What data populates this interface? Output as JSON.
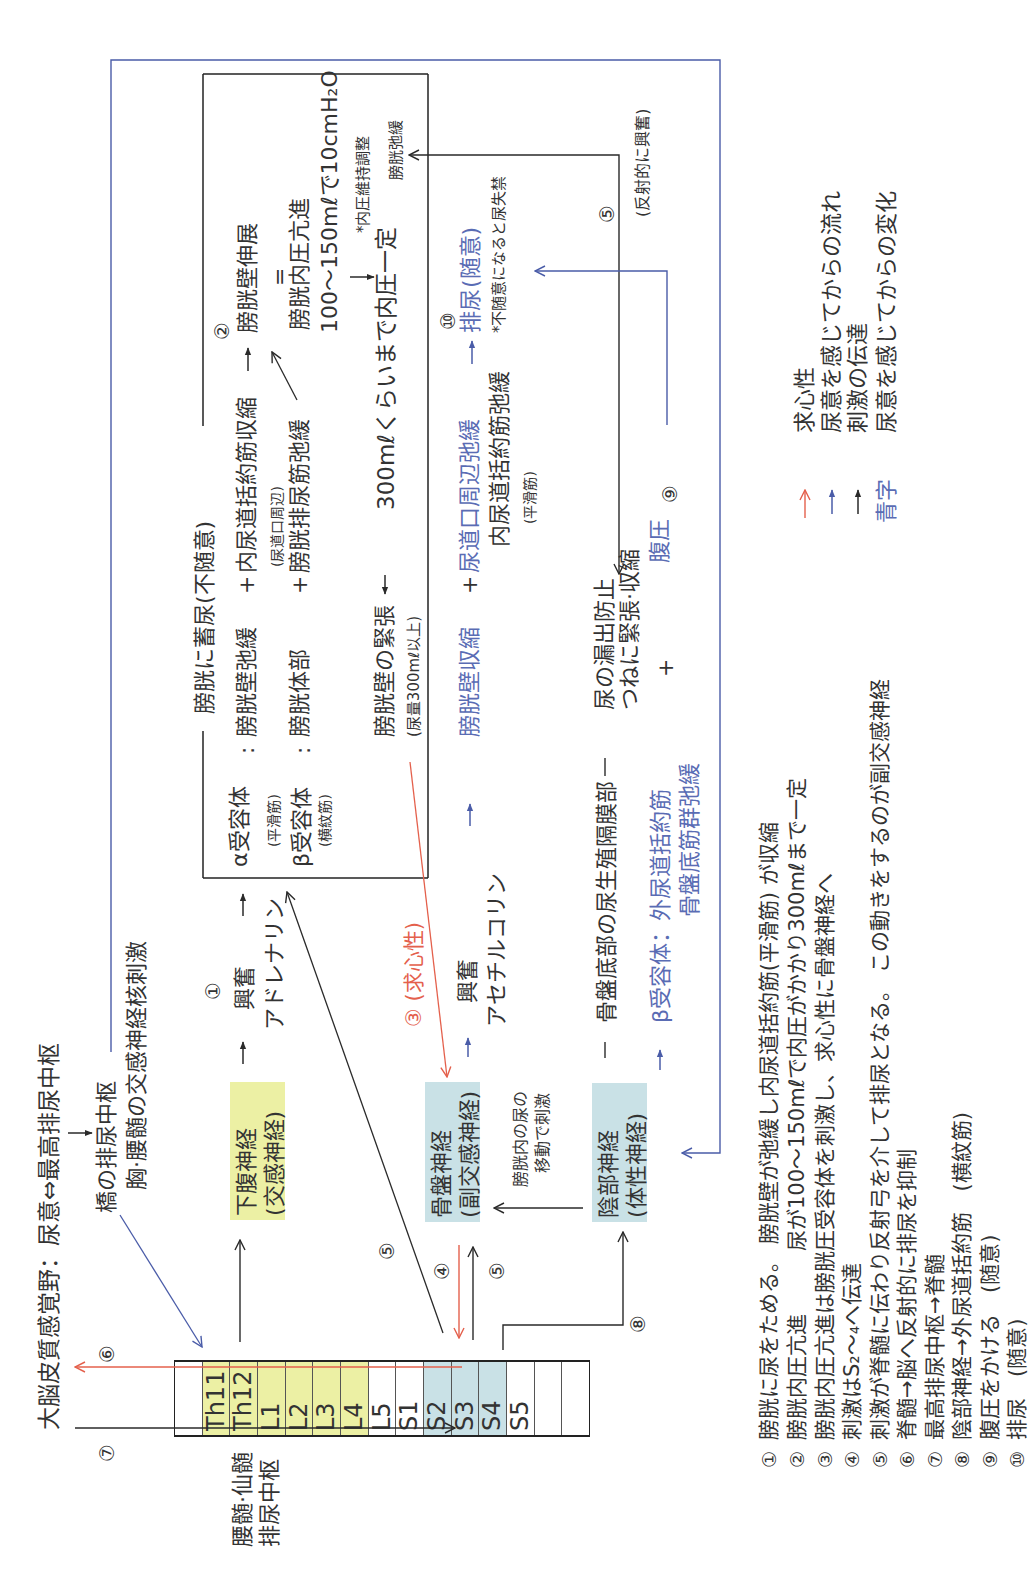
{
  "header": {
    "cortex": "大脳皮質感覚野：尿意⇔最高排尿中枢",
    "pons": "橋の排尿中枢",
    "pons_sub": "胸·腰髄の交感神経核刺激"
  },
  "spinal": {
    "label_line1": "腰髄·仙髄",
    "label_line2": "排尿中枢",
    "segments": [
      "",
      "Th11",
      "Th12",
      "L1",
      "L2",
      "L3",
      "L4",
      "L5",
      "S1",
      "S2",
      "S3",
      "S4",
      "S5",
      "",
      ""
    ]
  },
  "nerves": {
    "hypogastric": {
      "name": "下腹神経",
      "type": "(交感神経)"
    },
    "pelvic": {
      "name": "骨盤神経",
      "type": "(副交感神経)"
    },
    "pudendal": {
      "name": "陰部神経",
      "type": "(体性神経)"
    }
  },
  "markers": {
    "m1": "①",
    "m2": "②",
    "m4": "④",
    "m5": "⑤",
    "m6": "⑥",
    "m7": "⑦",
    "m8": "⑧",
    "m9": "⑨",
    "m10": "⑩"
  },
  "sympathetic_path": {
    "excite": "興奮",
    "transmitter": "アドレナリン"
  },
  "parasympathetic_path": {
    "afferent_label": "③ (求心性)",
    "excite": "興奮",
    "transmitter": "アセチルコリン",
    "stimulus_line1": "膀胱内の尿の",
    "stimulus_line2": "移動で刺激"
  },
  "storage_box": {
    "title": "膀胱に蓄尿(不随意)",
    "alpha": "α受容体",
    "alpha_type": "(平滑筋)",
    "beta": "β受容体",
    "beta_type": "(横紋筋)",
    "colon": ":",
    "wall_relax": "膀胱壁弛緩",
    "plus": "+",
    "internal_contract": "内尿道括約筋収縮",
    "internal_area": "(尿道口周辺)",
    "body": "膀胱体部",
    "detrusor_relax": "膀胱排尿筋弛緩",
    "stretch": "膀胱壁伸展",
    "equals": "=",
    "pressure": "膀胱内圧亢進",
    "pressure_value": "100〜150mℓで10cmH₂O",
    "maintain_note": "*内圧維持調整",
    "wall_tension": "膀胱壁の緊張",
    "volume_note": "(尿量300mℓ以上)",
    "constant": "300mℓくらいまで内圧一定",
    "relax": "膀胱弛緩"
  },
  "voiding": {
    "wall_contract": "膀胱壁収縮",
    "plus": "+",
    "urethral_relax": "尿道口周辺弛緩",
    "internal_relax": "内尿道括約筋弛緩",
    "internal_type": "(平滑筋)",
    "void": "排尿",
    "voluntary": "(随意)",
    "incontinence_note": "*不随意になると尿失禁"
  },
  "pelvic_floor": {
    "region": "骨盤底部の尿生殖隔膜部",
    "leak": "尿の漏出防止",
    "tension": "つねに緊張·収縮",
    "plus": "+",
    "abdominal": "腹圧",
    "beta_external": "β受容体：外尿道括約筋",
    "floor_relax": "骨盤底筋群弛緩",
    "reflex": "(反射的に興奮)"
  },
  "legend": [
    {
      "symbol": "red-arrow",
      "label": "求心性"
    },
    {
      "symbol": "blue-arrow",
      "label": "尿意を感じてからの流れ"
    },
    {
      "symbol": "black-arrow",
      "label": "刺激の伝達"
    },
    {
      "symbol": "青字",
      "label": "尿意を感じてからの変化"
    }
  ],
  "notes": [
    {
      "num": "①",
      "text": "膀胱に尿をためる。 膀胱壁が弛緩し内尿道括約筋(平滑筋) が収縮"
    },
    {
      "num": "②",
      "text": "膀胱内圧亢進　　　尿が100〜150mℓで内圧がかかり300mℓまで一定"
    },
    {
      "num": "③",
      "text": "膀胱内圧亢進は膀胱圧受容体を刺激し、求心性に骨盤神経へ"
    },
    {
      "num": "④",
      "text": "刺激はS₂〜₄へ伝達"
    },
    {
      "num": "⑤",
      "text": "刺激が脊髄に伝わり反射弓を介して排尿となる。 この動きをするのが副交感神経"
    },
    {
      "num": "⑥",
      "text": "脊髄→脳へ反射的に排尿を抑制"
    },
    {
      "num": "⑦",
      "text": "最高排尿中枢→脊髄"
    },
    {
      "num": "⑧",
      "text": "陰部神経→外尿道括約筋　(横紋筋)"
    },
    {
      "num": "⑨",
      "text": "腹圧をかける　(随意)"
    },
    {
      "num": "⑩",
      "text": "排尿　(随意)"
    }
  ],
  "colors": {
    "text": "#333333",
    "blue_text": "#5a6cb4",
    "blue_line": "#4a5ca8",
    "red": "#e4604c",
    "sympathetic_fill": "#ecf0a4",
    "parasympathetic_fill": "#c9e1e6"
  }
}
